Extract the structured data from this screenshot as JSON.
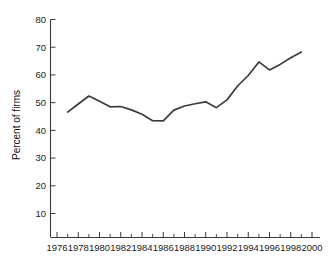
{
  "chart_data": {
    "type": "line",
    "title": "",
    "subtitle": "",
    "xlabel": "",
    "ylabel": "Percent of firms",
    "xlim": [
      1976,
      2000
    ],
    "ylim": [
      0,
      80
    ],
    "y_axis_visible_range": [
      10,
      80
    ],
    "grid": false,
    "legend": null,
    "x_tick_labels": [
      "1976",
      "1978",
      "1980",
      "1982",
      "1984",
      "1986",
      "1988",
      "1990",
      "1992",
      "1994",
      "1996",
      "1998",
      "2000"
    ],
    "x_tick_values": [
      1976,
      1978,
      1980,
      1982,
      1984,
      1986,
      1988,
      1990,
      1992,
      1994,
      1996,
      1998,
      2000
    ],
    "x_minor_tick_values": [
      1977,
      1979,
      1981,
      1983,
      1985,
      1987,
      1989,
      1991,
      1993,
      1995,
      1997,
      1999
    ],
    "y_tick_labels": [
      "10",
      "20",
      "30",
      "40",
      "50",
      "60",
      "70",
      "80"
    ],
    "y_tick_values": [
      10,
      20,
      30,
      40,
      50,
      60,
      70,
      80
    ],
    "x": [
      1977,
      1978,
      1979,
      1980,
      1981,
      1982,
      1983,
      1984,
      1985,
      1986,
      1987,
      1988,
      1989,
      1990,
      1991,
      1992,
      1993,
      1994,
      1995,
      1996,
      1997,
      1998,
      1999
    ],
    "values": [
      46.6,
      49.5,
      52.4,
      50.5,
      48.5,
      48.6,
      47.4,
      45.8,
      43.5,
      43.4,
      47.3,
      48.8,
      49.6,
      50.3,
      48.2,
      51.0,
      56.0,
      59.8,
      64.7,
      61.8,
      63.8,
      66.2,
      68.3
    ],
    "series": [
      {
        "name": "Percent of firms",
        "color": "#3c3c3c",
        "values": [
          46.6,
          49.5,
          52.4,
          50.5,
          48.5,
          48.6,
          47.4,
          45.8,
          43.5,
          43.4,
          47.3,
          48.8,
          49.6,
          50.3,
          48.2,
          51.0,
          56.0,
          59.8,
          64.7,
          61.8,
          63.8,
          66.2,
          68.3
        ]
      }
    ],
    "annotations": []
  },
  "colors": {
    "background": "#ffffff",
    "axis": "#3a3a3a",
    "line": "#3c3c3c",
    "text": "#222222"
  }
}
